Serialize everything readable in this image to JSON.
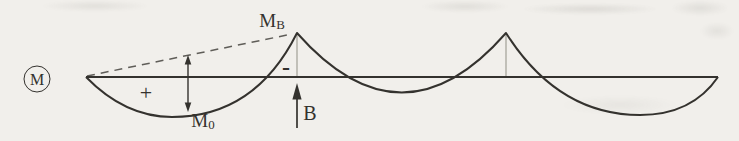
{
  "figure": {
    "kind": "bending-moment-diagram",
    "diagram_symbol": "M",
    "labels": {
      "peak_moment": {
        "base": "M",
        "sub": "B"
      },
      "span_moment": {
        "base": "M",
        "sub": "0"
      },
      "support": "B",
      "positive_sign": "+",
      "negative_sign": "-"
    },
    "colors": {
      "ink": "#34322e",
      "paper": "#f1efeb",
      "dashed_line": "#5f5d58",
      "thin_guide": "#a29f96"
    }
  }
}
